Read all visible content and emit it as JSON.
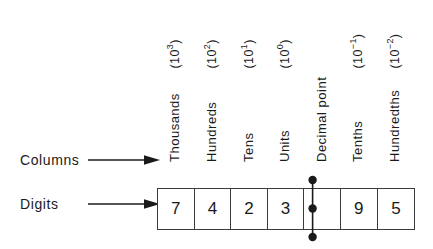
{
  "diagram": {
    "row_labels": {
      "columns": "Columns",
      "digits": "Digits"
    },
    "columns": [
      {
        "name": "Thousands",
        "exponent_base": "(10",
        "exponent_power": "3",
        "exponent_close": ")",
        "digit": "7"
      },
      {
        "name": "Hundreds",
        "exponent_base": "(10",
        "exponent_power": "2",
        "exponent_close": ")",
        "digit": "4"
      },
      {
        "name": "Tens",
        "exponent_base": "(10",
        "exponent_power": "1",
        "exponent_close": ")",
        "digit": "2"
      },
      {
        "name": "Units",
        "exponent_base": "(10",
        "exponent_power": "0",
        "exponent_close": ")",
        "digit": "3"
      },
      {
        "name": "Decimal point",
        "exponent_base": "",
        "exponent_power": "",
        "exponent_close": "",
        "digit": ""
      },
      {
        "name": "Tenths",
        "exponent_base": "(10",
        "exponent_power": "−1",
        "exponent_close": ")",
        "digit": "9"
      },
      {
        "name": "Hundredths",
        "exponent_base": "(10",
        "exponent_power": "−2",
        "exponent_close": ")",
        "digit": "5"
      }
    ],
    "number_represented": "7423.95",
    "colors": {
      "ink": "#1a1a1a",
      "rule": "#3b3b3b",
      "background": "#ffffff"
    }
  }
}
